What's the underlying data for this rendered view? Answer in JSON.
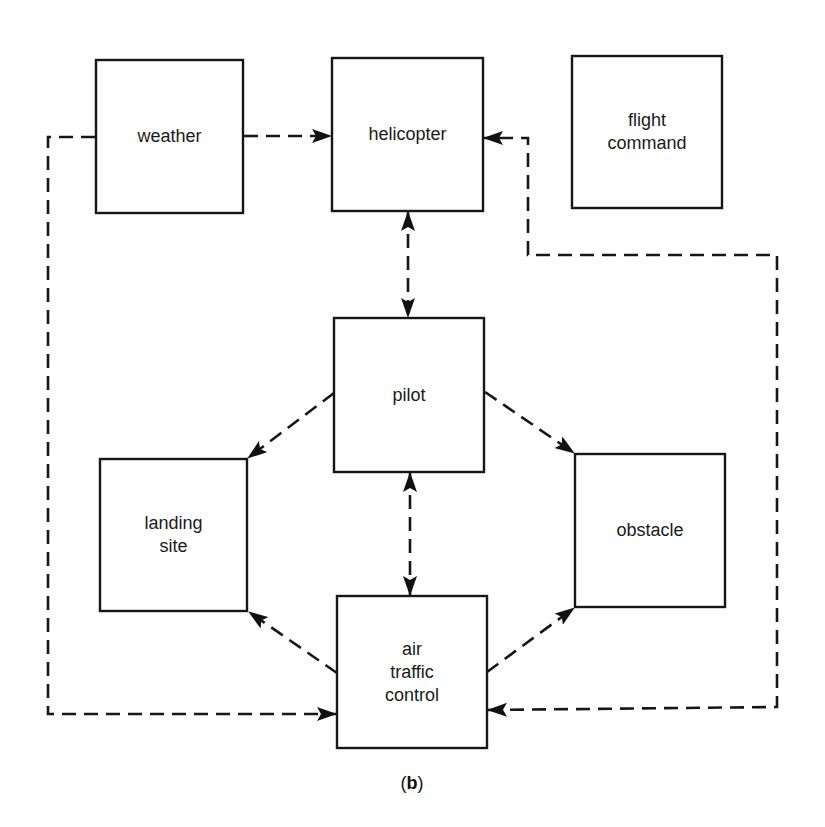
{
  "diagram": {
    "caption": {
      "open": "(",
      "letter": "b",
      "close": ")"
    },
    "nodes": [
      {
        "id": "weather",
        "lines": [
          "weather"
        ],
        "x": 96,
        "y": 60,
        "w": 147,
        "h": 153
      },
      {
        "id": "helicopter",
        "lines": [
          "helicopter"
        ],
        "x": 332,
        "y": 58,
        "w": 151,
        "h": 153
      },
      {
        "id": "flight-command",
        "lines": [
          "flight",
          "command"
        ],
        "x": 572,
        "y": 56,
        "w": 150,
        "h": 152
      },
      {
        "id": "pilot",
        "lines": [
          "pilot"
        ],
        "x": 334,
        "y": 318,
        "w": 150,
        "h": 154
      },
      {
        "id": "landing-site",
        "lines": [
          "landing",
          "site"
        ],
        "x": 100,
        "y": 459,
        "w": 147,
        "h": 152
      },
      {
        "id": "obstacle",
        "lines": [
          "obstacle"
        ],
        "x": 575,
        "y": 454,
        "w": 150,
        "h": 153
      },
      {
        "id": "air-traffic-control",
        "lines": [
          "air",
          "traffic",
          "control"
        ],
        "x": 337,
        "y": 596,
        "w": 150,
        "h": 152
      }
    ],
    "connections": [
      {
        "from": "weather",
        "to": "helicopter",
        "direction": "forward",
        "style": "dashed"
      },
      {
        "from": "helicopter",
        "to": "pilot",
        "direction": "both",
        "style": "dashed"
      },
      {
        "from": "pilot",
        "to": "landing-site",
        "direction": "forward",
        "style": "dashed"
      },
      {
        "from": "pilot",
        "to": "obstacle",
        "direction": "forward",
        "style": "dashed"
      },
      {
        "from": "pilot",
        "to": "air-traffic-control",
        "direction": "both",
        "style": "dashed"
      },
      {
        "from": "air-traffic-control",
        "to": "landing-site",
        "direction": "forward",
        "style": "dashed"
      },
      {
        "from": "air-traffic-control",
        "to": "obstacle",
        "direction": "forward",
        "style": "dashed"
      },
      {
        "from": "weather",
        "to": "air-traffic-control",
        "direction": "forward",
        "style": "dashed",
        "route": "left-loop"
      },
      {
        "from": "air-traffic-control",
        "to": "helicopter",
        "direction": "both",
        "style": "dashed",
        "route": "right-loop"
      }
    ],
    "colors": {
      "line": "#161616",
      "background": "#ffffff",
      "text": "#1a1a1a"
    }
  }
}
